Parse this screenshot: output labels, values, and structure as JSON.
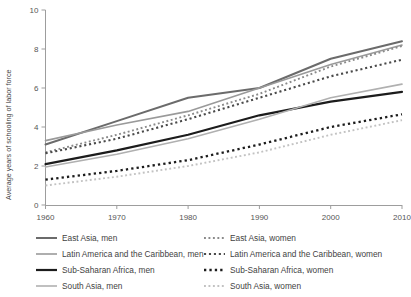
{
  "chart_data": {
    "type": "line",
    "title": "",
    "xlabel": "",
    "ylabel": "Average years of schooling of labor force",
    "xlim": [
      1960,
      2010
    ],
    "ylim": [
      0,
      10
    ],
    "x": [
      1960,
      1970,
      1980,
      1990,
      2000,
      2010
    ],
    "xticks": [
      "1960",
      "1970",
      "1980",
      "1990",
      "2000",
      "2010"
    ],
    "yticks": [
      "0",
      "2",
      "4",
      "6",
      "8",
      "10"
    ],
    "grid": false,
    "legend_position": "below",
    "series": [
      {
        "name": "East Asia, men",
        "values": [
          3.1,
          4.3,
          5.5,
          6.0,
          7.5,
          8.4
        ],
        "color": "#6b6b6b",
        "style": "solid",
        "width": 2.0
      },
      {
        "name": "Latin America and the Caribbean, men",
        "values": [
          3.3,
          4.1,
          4.8,
          6.0,
          7.2,
          8.2
        ],
        "color": "#9a9a9a",
        "style": "solid",
        "width": 1.6
      },
      {
        "name": "Sub-Saharan Africa, men",
        "values": [
          2.1,
          2.8,
          3.6,
          4.6,
          5.3,
          5.8
        ],
        "color": "#1c1c1c",
        "style": "solid",
        "width": 2.2
      },
      {
        "name": "South Asia, men",
        "values": [
          1.95,
          2.6,
          3.4,
          4.4,
          5.5,
          6.2
        ],
        "color": "#b0b0b0",
        "style": "solid",
        "width": 1.6
      },
      {
        "name": "East Asia, women",
        "values": [
          2.7,
          3.6,
          4.6,
          5.7,
          7.1,
          8.15
        ],
        "color": "#8a8a8a",
        "style": "dotted",
        "width": 1.9
      },
      {
        "name": "Latin America and the Caribbean, women",
        "values": [
          2.65,
          3.4,
          4.4,
          5.5,
          6.6,
          7.45
        ],
        "color": "#4a4a4a",
        "style": "dotted",
        "width": 2.1
      },
      {
        "name": "Sub-Saharan Africa, women",
        "values": [
          1.3,
          1.75,
          2.3,
          3.1,
          4.0,
          4.65
        ],
        "color": "#1c1c1c",
        "style": "dotted",
        "width": 2.3
      },
      {
        "name": "South Asia, women",
        "values": [
          1.0,
          1.45,
          2.0,
          2.7,
          3.6,
          4.35
        ],
        "color": "#c2c2c2",
        "style": "dotted",
        "width": 1.9
      }
    ]
  },
  "legend": {
    "columns": [
      [
        {
          "label": "East Asia, men",
          "series": 0
        },
        {
          "label": "Latin America and the Caribbean, men",
          "series": 1
        },
        {
          "label": "Sub-Saharan Africa, men",
          "series": 2
        },
        {
          "label": "South Asia, men",
          "series": 3
        }
      ],
      [
        {
          "label": "East Asia, women",
          "series": 4
        },
        {
          "label": "Latin America and the Caribbean, women",
          "series": 5
        },
        {
          "label": "Sub-Saharan Africa, women",
          "series": 6
        },
        {
          "label": "South Asia, women",
          "series": 7
        }
      ]
    ]
  },
  "axes": {
    "axis_color": "#9d9d9d",
    "tick_color": "#9d9d9d"
  }
}
